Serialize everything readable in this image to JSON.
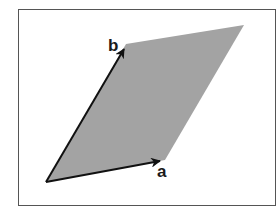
{
  "diagram": {
    "type": "parallelogram spanned by two vectors",
    "frame": {
      "x": 18,
      "y": 9,
      "width": 258,
      "height": 197,
      "stroke": "#555555"
    },
    "parallelogram": {
      "fill": "#a3a3a3",
      "vertices": [
        [
          46,
          182
        ],
        [
          165,
          160
        ],
        [
          244,
          25
        ],
        [
          126,
          44
        ]
      ]
    },
    "vectors": [
      {
        "name": "a",
        "label": "a",
        "from": [
          46,
          182
        ],
        "to": [
          165,
          160
        ],
        "label_pos": [
          159,
          177
        ]
      },
      {
        "name": "b",
        "label": "b",
        "from": [
          46,
          182
        ],
        "to": [
          126,
          44
        ],
        "label_pos": [
          108,
          52
        ]
      }
    ],
    "colors": {
      "vector": "#111111",
      "label": "#1a1a1a"
    }
  }
}
